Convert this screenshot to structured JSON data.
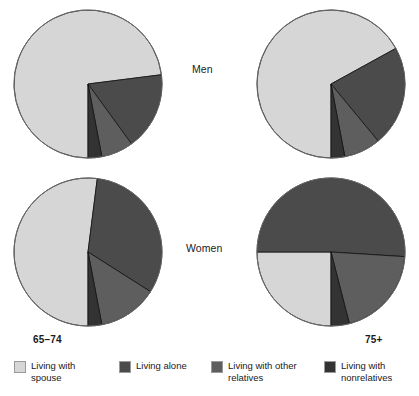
{
  "chart_data": {
    "type": "pie",
    "title": "",
    "subtitle": "",
    "xlabel": "",
    "ylabel": "",
    "grid": false,
    "legend_position": "bottom",
    "categories": [
      "Living with spouse",
      "Living alone",
      "Living with other relatives",
      "Living with nonrelatives"
    ],
    "colors": [
      "#d6d6d6",
      "#4b4b4b",
      "#5e5e5e",
      "#333333"
    ],
    "row_labels": [
      "Men",
      "Women"
    ],
    "column_labels": [
      "65–74",
      "75+"
    ],
    "panels": [
      {
        "id": "men-65-74",
        "row": "Men",
        "column": "65–74",
        "start_angle_deg": 180,
        "direction": "clockwise",
        "values": [
          73,
          17,
          7,
          3
        ]
      },
      {
        "id": "men-75-plus",
        "row": "Men",
        "column": "75+",
        "start_angle_deg": 180,
        "direction": "clockwise",
        "values": [
          67,
          22,
          8,
          3
        ]
      },
      {
        "id": "women-65-74",
        "row": "Women",
        "column": "65–74",
        "start_angle_deg": 180,
        "direction": "clockwise",
        "values": [
          52,
          32,
          13,
          3
        ]
      },
      {
        "id": "women-75-plus",
        "row": "Women",
        "column": "75+",
        "start_angle_deg": 180,
        "direction": "clockwise",
        "values": [
          25,
          51,
          20,
          4
        ]
      }
    ]
  },
  "legend": {
    "items": [
      {
        "label": "Living with\nspouse",
        "color": "#d6d6d6"
      },
      {
        "label": "Living alone",
        "color": "#4b4b4b"
      },
      {
        "label": "Living with other\nrelatives",
        "color": "#5e5e5e"
      },
      {
        "label": "Living with\nnonrelatives",
        "color": "#333333"
      }
    ]
  },
  "labels": {
    "men": "Men",
    "women": "Women",
    "age_65_74": "65–74",
    "age_75_plus": "75+"
  }
}
